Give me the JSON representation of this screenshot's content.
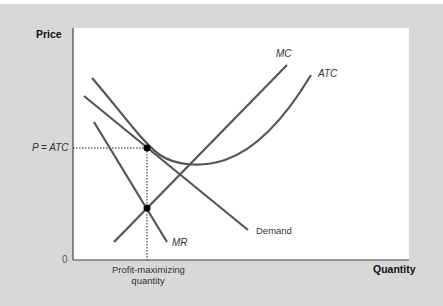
{
  "diagram": {
    "y_axis_label": "Price",
    "x_axis_label": "Quantity",
    "origin_label": "0",
    "price_label": "P = ATC",
    "quantity_label_line1": "Profit-maximizing",
    "quantity_label_line2": "quantity",
    "curves": {
      "mc": "MC",
      "atc": "ATC",
      "demand": "Demand",
      "mr": "MR"
    },
    "colors": {
      "background": "#d8d8d8",
      "plot": "#ffffff",
      "curve": "#555555",
      "point": "#000000"
    }
  }
}
